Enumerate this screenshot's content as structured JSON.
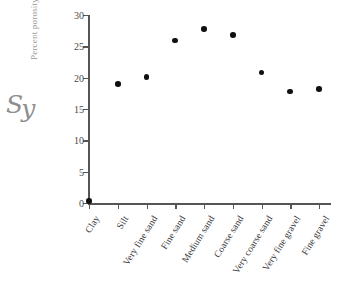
{
  "annotation": {
    "handwritten_label": "S",
    "handwritten_sub": "y"
  },
  "chart_data": {
    "type": "scatter",
    "title": "",
    "xlabel": "",
    "ylabel": "Percent porosity",
    "categories": [
      "Clay",
      "Silt",
      "Very fine sand",
      "Fine sand",
      "Medium sand",
      "Coarse sand",
      "Very coarse sand",
      "Very fine gravel",
      "Fine gravel"
    ],
    "values": [
      0.3,
      19.0,
      20.1,
      25.9,
      27.8,
      26.8,
      20.8,
      17.8,
      18.2
    ],
    "ylim": [
      0,
      30
    ],
    "yticks": [
      0,
      5,
      10,
      15,
      20,
      25,
      30
    ],
    "ytick_labels": [
      "0",
      "5",
      "10",
      "15",
      "20",
      "25",
      "30"
    ],
    "grid": false,
    "legend": false,
    "marker": "filled-circle",
    "marker_color": "#111111",
    "axis_color": "#555555"
  }
}
